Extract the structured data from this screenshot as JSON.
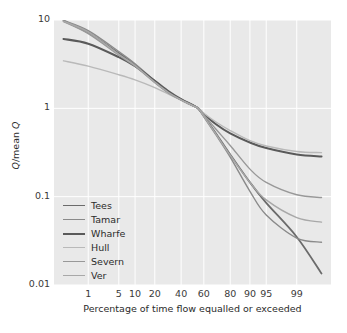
{
  "chart_data": {
    "type": "line",
    "title": "",
    "subtitle": "",
    "xlabel": "Percentage of time flow equalled or exceeded",
    "ylabel": "Q/mean Q",
    "ylabel_parts": {
      "italic1": "Q",
      "plain": "/mean ",
      "italic2": "Q"
    },
    "x_scale": "normal-probability",
    "y_scale": "log10",
    "ylim": [
      0.01,
      10
    ],
    "xlim": [
      0.1,
      99.9
    ],
    "grid": true,
    "grid_color": "#ffffff",
    "plot_background": "#e9e9e9",
    "legend_position": "lower-left-inside",
    "y_ticks": [
      "10",
      "1",
      "0.1",
      "0.01"
    ],
    "y_tick_values": [
      10,
      1,
      0.1,
      0.01
    ],
    "x_ticks": [
      "1",
      "5",
      "10",
      "20",
      "40",
      "60",
      "80",
      "90",
      "95",
      "99"
    ],
    "x_tick_values": [
      1,
      5,
      10,
      20,
      40,
      60,
      80,
      90,
      95,
      99
    ],
    "series": [
      {
        "name": "Tees",
        "color": "#6b6b6b",
        "width": 1.8,
        "x": [
          0.2,
          1,
          5,
          10,
          20,
          30,
          40,
          50,
          55,
          60,
          70,
          80,
          90,
          95,
          99,
          99.8
        ],
        "values": [
          9.8,
          7.2,
          4.2,
          3.1,
          2.0,
          1.5,
          1.25,
          1.08,
          1.0,
          0.82,
          0.52,
          0.3,
          0.145,
          0.085,
          0.035,
          0.0135
        ]
      },
      {
        "name": "Tamar",
        "color": "#8a8a8a",
        "width": 1.4,
        "x": [
          0.2,
          1,
          5,
          10,
          20,
          30,
          40,
          50,
          55,
          60,
          70,
          80,
          90,
          95,
          99,
          99.8
        ],
        "values": [
          9.9,
          7.6,
          4.4,
          3.2,
          2.05,
          1.52,
          1.26,
          1.08,
          1.0,
          0.8,
          0.5,
          0.28,
          0.115,
          0.062,
          0.034,
          0.0305
        ]
      },
      {
        "name": "Wharfe",
        "color": "#5a5a5a",
        "width": 2.1,
        "x": [
          0.2,
          1,
          5,
          10,
          20,
          30,
          40,
          50,
          55,
          60,
          70,
          80,
          90,
          95,
          99,
          99.8
        ],
        "values": [
          6.1,
          5.4,
          3.8,
          3.0,
          2.05,
          1.55,
          1.27,
          1.09,
          1.0,
          0.86,
          0.66,
          0.52,
          0.41,
          0.355,
          0.3,
          0.285
        ]
      },
      {
        "name": "Hull",
        "color": "#b9b9b9",
        "width": 1.4,
        "x": [
          0.2,
          1,
          5,
          10,
          20,
          30,
          40,
          50,
          55,
          60,
          70,
          80,
          90,
          95,
          99,
          99.8
        ],
        "values": [
          3.45,
          3.0,
          2.4,
          2.1,
          1.72,
          1.44,
          1.24,
          1.08,
          1.0,
          0.88,
          0.7,
          0.56,
          0.43,
          0.375,
          0.325,
          0.315
        ]
      },
      {
        "name": "Severn",
        "color": "#989898",
        "width": 1.4,
        "x": [
          0.2,
          1,
          5,
          10,
          20,
          30,
          40,
          50,
          55,
          60,
          70,
          80,
          90,
          95,
          99,
          99.8
        ],
        "values": [
          9.6,
          7.0,
          4.0,
          3.0,
          1.95,
          1.48,
          1.24,
          1.07,
          1.0,
          0.84,
          0.58,
          0.38,
          0.205,
          0.145,
          0.105,
          0.098
        ]
      },
      {
        "name": "Ver",
        "color": "#a8a8a8",
        "width": 1.4,
        "x": [
          0.2,
          1,
          5,
          10,
          20,
          30,
          40,
          50,
          55,
          60,
          70,
          80,
          90,
          95,
          99,
          99.8
        ],
        "values": [
          9.7,
          7.3,
          4.1,
          3.05,
          1.98,
          1.5,
          1.25,
          1.07,
          1.0,
          0.81,
          0.51,
          0.295,
          0.145,
          0.092,
          0.058,
          0.0515
        ]
      }
    ]
  },
  "legend": {
    "items": [
      {
        "label": "Tees"
      },
      {
        "label": "Tamar"
      },
      {
        "label": "Wharfe"
      },
      {
        "label": "Hull"
      },
      {
        "label": "Severn"
      },
      {
        "label": "Ver"
      }
    ]
  }
}
